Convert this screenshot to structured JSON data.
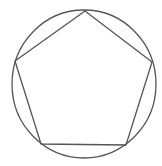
{
  "diagram": {
    "title": "",
    "background": "#ffffff",
    "stroke_color": "#555555",
    "stroke_width": 1.3,
    "circle": {
      "cx": 84,
      "cy": 84,
      "rx": 72,
      "ry": 74
    },
    "pentagon": {
      "vertices": [
        {
          "x": 85,
          "y": 11
        },
        {
          "x": 152,
          "y": 62
        },
        {
          "x": 126,
          "y": 145
        },
        {
          "x": 41,
          "y": 144
        },
        {
          "x": 15,
          "y": 61
        }
      ]
    }
  }
}
